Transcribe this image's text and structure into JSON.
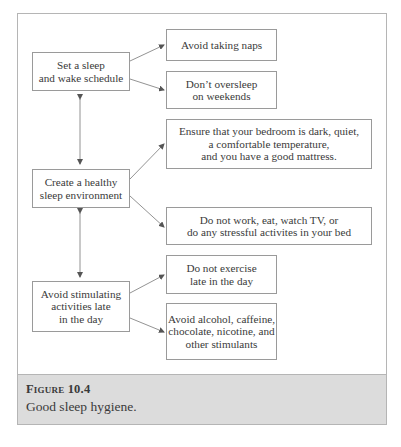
{
  "figure": {
    "label": "Figure 10.4",
    "caption": "Good sleep hygiene."
  },
  "nodes": {
    "schedule": "Set a sleep\nand wake schedule",
    "environment": "Create a healthy\nsleep environment",
    "stimulating": "Avoid stimulating\nactivities late\nin the day",
    "naps": "Avoid taking naps",
    "oversleep": "Don’t oversleep\non weekends",
    "bedroom": "Ensure that your bedroom is dark, quiet,\na comfortable temperature,\nand you have a good mattress.",
    "bed_use": "Do not work, eat, watch TV, or\ndo any stressful activites in your bed",
    "exercise": "Do not exercise\nlate in the day",
    "substances": "Avoid alcohol, caffeine,\nchocolate, nicotine, and\nother stimulants"
  },
  "edges": [
    {
      "from": "schedule",
      "to": "naps",
      "type": "arrow"
    },
    {
      "from": "schedule",
      "to": "oversleep",
      "type": "arrow"
    },
    {
      "from": "schedule",
      "to": "environment",
      "type": "double-arrow"
    },
    {
      "from": "environment",
      "to": "bedroom",
      "type": "arrow"
    },
    {
      "from": "environment",
      "to": "bed_use",
      "type": "arrow"
    },
    {
      "from": "environment",
      "to": "stimulating",
      "type": "double-arrow"
    },
    {
      "from": "stimulating",
      "to": "exercise",
      "type": "arrow"
    },
    {
      "from": "stimulating",
      "to": "substances",
      "type": "arrow"
    }
  ],
  "colors": {
    "border": "#9a9a9a",
    "caption_bg": "#dcdcdc",
    "text": "#3a3a3a"
  }
}
